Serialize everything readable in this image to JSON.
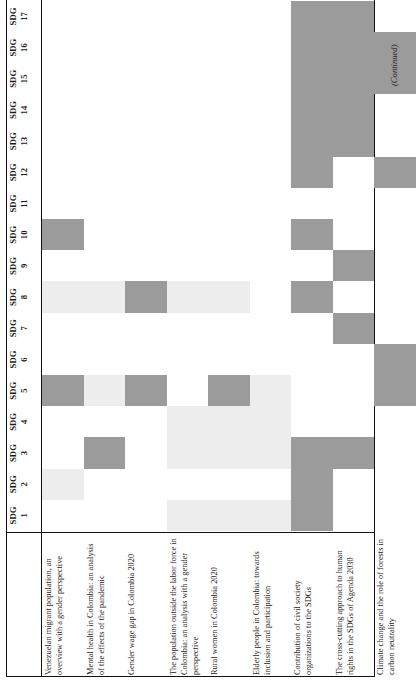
{
  "table": {
    "column_header_prefix": "SDG",
    "columns": [
      {
        "prefix": "SDG",
        "number": "1"
      },
      {
        "prefix": "SDG",
        "number": "2"
      },
      {
        "prefix": "SDG",
        "number": "3"
      },
      {
        "prefix": "SDG",
        "number": "4"
      },
      {
        "prefix": "SDG",
        "number": "5"
      },
      {
        "prefix": "SDG",
        "number": "6"
      },
      {
        "prefix": "SDG",
        "number": "7"
      },
      {
        "prefix": "SDG",
        "number": "8"
      },
      {
        "prefix": "SDG",
        "number": "9"
      },
      {
        "prefix": "SDG",
        "number": "10"
      },
      {
        "prefix": "SDG",
        "number": "11"
      },
      {
        "prefix": "SDG",
        "number": "12"
      },
      {
        "prefix": "SDG",
        "number": "13"
      },
      {
        "prefix": "SDG",
        "number": "14"
      },
      {
        "prefix": "SDG",
        "number": "15"
      },
      {
        "prefix": "SDG",
        "number": "16"
      },
      {
        "prefix": "SDG",
        "number": "17"
      }
    ],
    "rows": [
      {
        "label": "Venezuelan migrant population, an overview with a gender perspective"
      },
      {
        "label": "Mental health in Colombia: an analysis of the effects of the pandemic"
      },
      {
        "label": "Gender wage gap in Colombia 2020"
      },
      {
        "label": "The population outside the labor force in Colombia: an analysis with a gender perspective"
      },
      {
        "label": "Rural women in Colombia 2020"
      },
      {
        "label": "Elderly people in Colombia: towards inclusion and participation"
      },
      {
        "label": "Contribution of civil society organizations to the SDGs"
      },
      {
        "label": "The cross-cutting approach to human rights in the SDGs of Agenda 2030"
      },
      {
        "label": "Climate change and the role of forests in carbon neutrality"
      }
    ],
    "footer_note": "(Continued)",
    "colors": {
      "dark": "#9b9b9b",
      "light": "#ededed",
      "none": "transparent",
      "rule": "#111111"
    }
  },
  "chart_data": {
    "type": "heatmap",
    "title": "",
    "xlabel": "",
    "ylabel": "",
    "legend": [
      {
        "level": "dark",
        "color": "#9b9b9b"
      },
      {
        "level": "light",
        "color": "#ededed"
      },
      {
        "level": "none",
        "color": "transparent"
      }
    ],
    "categories": [
      "SDG 1",
      "SDG 2",
      "SDG 3",
      "SDG 4",
      "SDG 5",
      "SDG 6",
      "SDG 7",
      "SDG 8",
      "SDG 9",
      "SDG 10",
      "SDG 11",
      "SDG 12",
      "SDG 13",
      "SDG 14",
      "SDG 15",
      "SDG 16",
      "SDG 17"
    ],
    "row_labels": [
      "Venezuelan migrant population, an overview with a gender perspective",
      "Mental health in Colombia: an analysis of the effects of the pandemic",
      "Gender wage gap in Colombia 2020",
      "The population outside the labor force in Colombia: an analysis with a gender perspective",
      "Rural women in Colombia 2020",
      "Elderly people in Colombia: towards inclusion and participation",
      "Contribution of civil society organizations to the SDGs",
      "The cross-cutting approach to human rights in the SDGs of Agenda 2030",
      "Climate change and the role of forests in carbon neutrality"
    ],
    "matrix": [
      [
        "none",
        "light",
        "none",
        "none",
        "dark",
        "none",
        "none",
        "light",
        "none",
        "dark",
        "none",
        "none",
        "none",
        "none",
        "none",
        "none",
        "none"
      ],
      [
        "none",
        "none",
        "dark",
        "none",
        "light",
        "none",
        "none",
        "light",
        "none",
        "none",
        "none",
        "none",
        "none",
        "none",
        "none",
        "none",
        "none"
      ],
      [
        "none",
        "none",
        "none",
        "none",
        "dark",
        "none",
        "none",
        "dark",
        "none",
        "none",
        "none",
        "none",
        "none",
        "none",
        "none",
        "none",
        "none"
      ],
      [
        "light",
        "none",
        "light",
        "light",
        "none",
        "none",
        "none",
        "light",
        "none",
        "none",
        "none",
        "none",
        "none",
        "none",
        "none",
        "none",
        "none"
      ],
      [
        "light",
        "none",
        "light",
        "light",
        "dark",
        "none",
        "none",
        "light",
        "none",
        "none",
        "none",
        "none",
        "none",
        "none",
        "none",
        "none",
        "none"
      ],
      [
        "light",
        "none",
        "light",
        "light",
        "light",
        "none",
        "none",
        "none",
        "none",
        "none",
        "none",
        "none",
        "none",
        "none",
        "none",
        "none",
        "none"
      ],
      [
        "dark",
        "dark",
        "dark",
        "none",
        "none",
        "none",
        "none",
        "dark",
        "none",
        "dark",
        "none",
        "dark",
        "dark",
        "dark",
        "dark",
        "dark",
        "dark"
      ],
      [
        "none",
        "none",
        "dark",
        "none",
        "none",
        "none",
        "dark",
        "none",
        "dark",
        "none",
        "none",
        "none",
        "dark",
        "dark",
        "dark",
        "dark",
        "dark"
      ],
      [
        "none",
        "none",
        "none",
        "none",
        "dark",
        "dark",
        "none",
        "none",
        "none",
        "none",
        "none",
        "dark",
        "none",
        "none",
        "dark",
        "dark",
        "none"
      ]
    ]
  }
}
